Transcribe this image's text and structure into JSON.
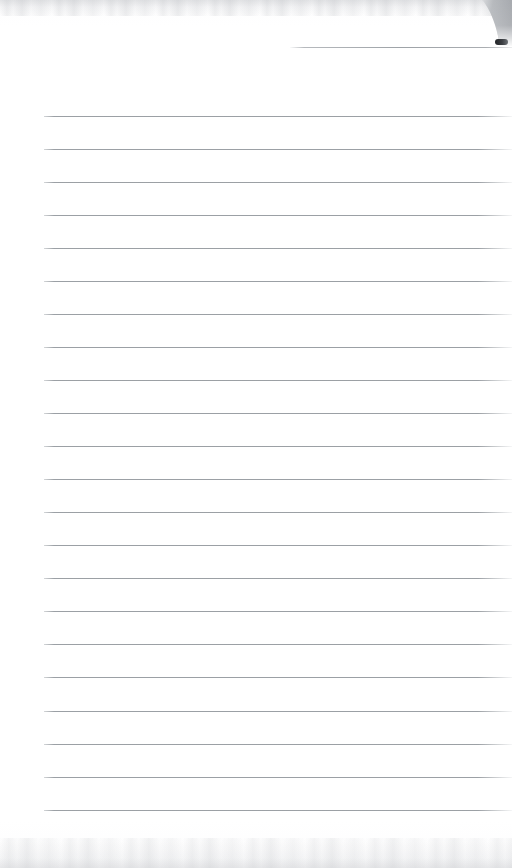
{
  "document": {
    "title": "Blank Lined Notepad Page",
    "kind": "scanned-paper",
    "width_px": 512,
    "height_px": 868,
    "paper_color": "#ffffff",
    "has_text_content": false,
    "text_content": ""
  },
  "rules": {
    "line_color": "#969ba0",
    "line_color_light": "#b0b4b8",
    "line_thickness_px": 1,
    "left_margin_px": 44,
    "right_edge_px": 512,
    "spacing_px": 33,
    "count": 22,
    "first_line_y_px": 116,
    "last_line_y_px": 810,
    "y_positions": [
      116,
      149,
      182,
      215,
      248,
      281,
      314,
      347,
      380,
      413,
      446,
      479,
      512,
      545,
      578,
      611,
      644,
      677,
      711,
      744,
      777,
      810
    ]
  },
  "header_rule": {
    "name": "top-short-rule",
    "y_px": 47,
    "start_x_px": 290,
    "end_x_px": 512,
    "color": "#969ba0"
  },
  "corner_artifact": {
    "name": "folded-page-corner",
    "position": "top-right",
    "x_px": 486,
    "y_px": 0,
    "width_px": 34,
    "height_px": 48,
    "fill_color": "#a8abb0",
    "edge_color": "#c6c9cd",
    "mark_color": "#2a2c2f"
  },
  "scan_texture": {
    "top_band": {
      "y_px": 0,
      "height_px": 16,
      "color": "#a8abb0"
    },
    "bottom_band": {
      "y_px": 838,
      "height_px": 30,
      "color": "#a8abb0"
    }
  }
}
